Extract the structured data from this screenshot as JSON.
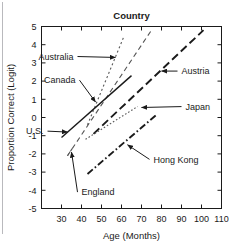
{
  "chart_data": {
    "type": "line",
    "title": "Country",
    "xlabel": "Age (Months)",
    "ylabel": "Proportion Correct (Logit)",
    "xlim": [
      20,
      110
    ],
    "ylim": [
      -5,
      5
    ],
    "xticks": [
      30,
      40,
      50,
      60,
      70,
      80,
      90,
      100,
      110
    ],
    "xticklabels": [
      "30",
      "40",
      "50",
      "60",
      "70",
      "80",
      "90",
      "100",
      "110"
    ],
    "yticks": [
      -5,
      -4,
      -3,
      -2,
      -1,
      0,
      1,
      2,
      3,
      4,
      5
    ],
    "yticklabels": [
      "-5",
      "-4",
      "-3",
      "-2",
      "-1",
      "0",
      "1",
      "2",
      "3",
      "4",
      "5"
    ],
    "grid": false,
    "legend_position": "inline-annotations",
    "series": [
      {
        "name": "Australia",
        "style": "dotted",
        "color": "#555555",
        "x": [
          43,
          61
        ],
        "y": [
          -0.4,
          4.4
        ]
      },
      {
        "name": "Canada",
        "style": "dashed",
        "color": "#555555",
        "x": [
          33,
          75
        ],
        "y": [
          -2.1,
          4.8
        ]
      },
      {
        "name": "U.S.",
        "style": "solid",
        "color": "#1a1a1a",
        "x": [
          30,
          65
        ],
        "y": [
          -1.1,
          2.3
        ]
      },
      {
        "name": "Austria",
        "style": "long-dash",
        "color": "#1a1a1a",
        "x": [
          46,
          101
        ],
        "y": [
          -0.9,
          4.8
        ]
      },
      {
        "name": "Japan",
        "style": "fine-dotted",
        "color": "#555555",
        "x": [
          42,
          68
        ],
        "y": [
          -1.2,
          0.6
        ]
      },
      {
        "name": "Hong Kong",
        "style": "dash-dot",
        "color": "#1a1a1a",
        "x": [
          43,
          78
        ],
        "y": [
          -3.1,
          0.2
        ]
      },
      {
        "name": "England",
        "style": "short-dash",
        "color": "#555555",
        "x": [
          33,
          36
        ],
        "y": [
          -2.1,
          -1.6
        ]
      }
    ],
    "annotations": [
      {
        "label": "Australia",
        "text_x": 36,
        "text_y": 3.35,
        "arrow_to_x": 57,
        "arrow_to_y": 3.3
      },
      {
        "label": "Canada",
        "text_x": 37,
        "text_y": 2.05,
        "arrow_to_x": 47,
        "arrow_to_y": 0.85
      },
      {
        "label": "U.S.",
        "text_x": 21,
        "text_y": -0.75,
        "arrow_to_x": 33,
        "arrow_to_y": -0.8
      },
      {
        "label": "Austria",
        "text_x": 90,
        "text_y": 2.55,
        "arrow_to_x": 80,
        "arrow_to_y": 2.55
      },
      {
        "label": "Japan",
        "text_x": 92,
        "text_y": 0.6,
        "arrow_to_x": 70,
        "arrow_to_y": 0.55
      },
      {
        "label": "Hong Kong",
        "text_x": 76,
        "text_y": -2.3,
        "arrow_to_x": 63,
        "arrow_to_y": -1.5
      },
      {
        "label": "England",
        "text_x": 40,
        "text_y": -4.1,
        "arrow_to_x": 35,
        "arrow_to_y": -1.9
      }
    ]
  }
}
